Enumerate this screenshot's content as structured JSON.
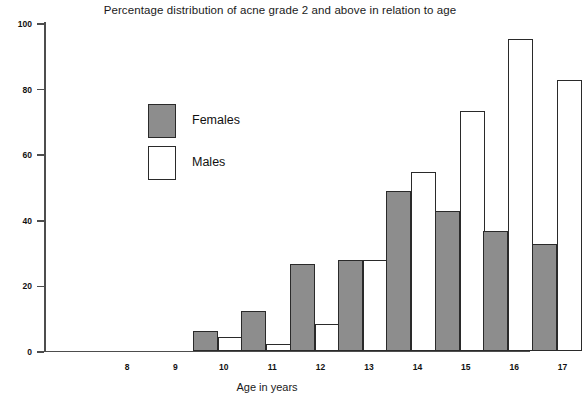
{
  "chart_data": {
    "type": "bar",
    "title": "Percentage distribution of acne grade 2 and above in relation to age",
    "xlabel": "Age in years",
    "ylabel": "",
    "categories": [
      "8",
      "9",
      "10",
      "11",
      "12",
      "13",
      "14",
      "15",
      "16",
      "17"
    ],
    "series": [
      {
        "name": "Females",
        "color": "#8d8d8d",
        "values": [
          0,
          0,
          6,
          12,
          26.5,
          27.5,
          48.5,
          42.5,
          36.5,
          32.5
        ]
      },
      {
        "name": "Males",
        "color": "#ffffff",
        "values": [
          0,
          0,
          4,
          2,
          8,
          27.5,
          54.5,
          73,
          95,
          82.5
        ]
      }
    ],
    "ylim": [
      0,
      100
    ],
    "yticks": [
      0,
      20,
      40,
      60,
      80,
      100
    ],
    "ytick_labels": [
      "0",
      "20",
      "40",
      "60",
      "80",
      "100"
    ],
    "grid": false,
    "legend_position": "inside-upper-left"
  },
  "legend": {
    "items": [
      {
        "label": "Females",
        "swatch": "filled-gray-swatch"
      },
      {
        "label": "Males",
        "swatch": "outline-white-swatch"
      }
    ]
  }
}
